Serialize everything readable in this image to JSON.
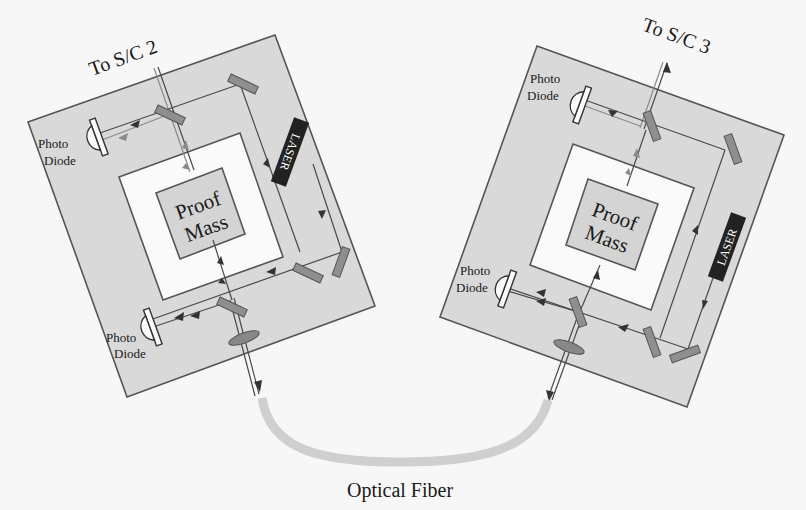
{
  "diagram": {
    "left_spacecraft": {
      "link_label": "To S/C 2",
      "proof_mass_line1": "Proof",
      "proof_mass_line2": "Mass",
      "laser_label": "LASER",
      "photodiode_top_line1": "Photo",
      "photodiode_top_line2": "Diode",
      "photodiode_bottom_line1": "Photo",
      "photodiode_bottom_line2": "Diode"
    },
    "right_spacecraft": {
      "link_label": "To S/C 3",
      "proof_mass_line1": "Proof",
      "proof_mass_line2": "Mass",
      "laser_label": "LASER",
      "photodiode_top_line1": "Photo",
      "photodiode_top_line2": "Diode",
      "photodiode_bottom_line1": "Photo",
      "photodiode_bottom_line2": "Diode"
    },
    "fiber_label": "Optical Fiber",
    "colors": {
      "frame_fill": "#d9d9d9",
      "inner_fill": "#fafafa",
      "laser_fill": "#222222",
      "mirror_fill": "#8f8f8f",
      "fiber": "#cfcfcf",
      "background": "#f7f7f7"
    }
  }
}
